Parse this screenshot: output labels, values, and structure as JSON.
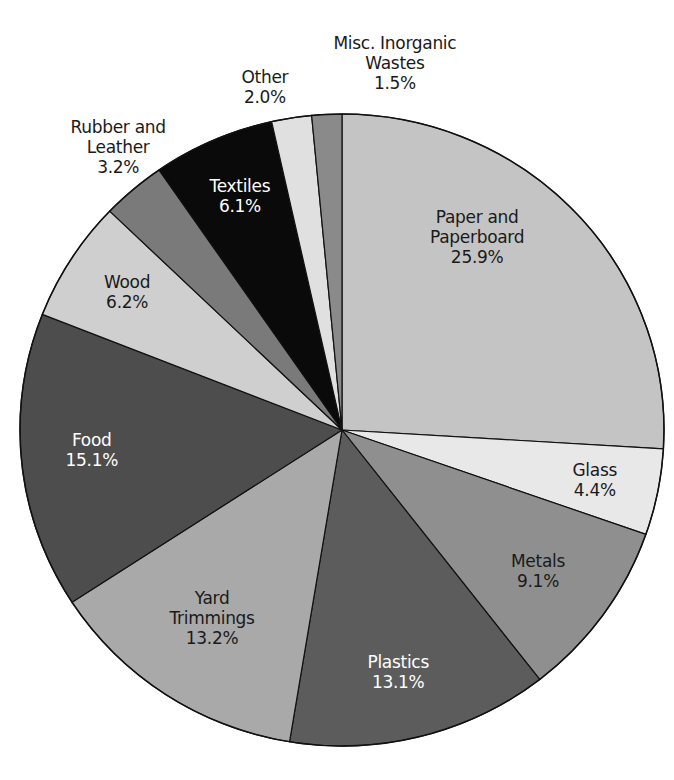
{
  "chart_data": {
    "type": "pie",
    "title": "",
    "start_angle_deg": 0,
    "direction": "clockwise",
    "slices": [
      {
        "name": "Paper and Paperboard",
        "lines": [
          "Paper and",
          "Paperboard",
          "25.9%"
        ],
        "value": 25.9,
        "color": "#c4c4c4",
        "label_pos": [
          477,
          237
        ],
        "light": false
      },
      {
        "name": "Glass",
        "lines": [
          "Glass",
          "4.4%"
        ],
        "value": 4.4,
        "color": "#e8e8e8",
        "label_pos": [
          595,
          480
        ],
        "light": false
      },
      {
        "name": "Metals",
        "lines": [
          "Metals",
          "9.1%"
        ],
        "value": 9.1,
        "color": "#8f8f8f",
        "label_pos": [
          538,
          571
        ],
        "light": false
      },
      {
        "name": "Plastics",
        "lines": [
          "Plastics",
          "13.1%"
        ],
        "value": 13.1,
        "color": "#5c5c5c",
        "label_pos": [
          398,
          672
        ],
        "light": true
      },
      {
        "name": "Yard Trimmings",
        "lines": [
          "Yard",
          "Trimmings",
          "13.2%"
        ],
        "value": 13.2,
        "color": "#a9a9a9",
        "label_pos": [
          212,
          618
        ],
        "light": false
      },
      {
        "name": "Food",
        "lines": [
          "Food",
          "15.1%"
        ],
        "value": 15.1,
        "color": "#4d4d4d",
        "label_pos": [
          92,
          450
        ],
        "light": true
      },
      {
        "name": "Wood",
        "lines": [
          "Wood",
          "6.2%"
        ],
        "value": 6.2,
        "color": "#cfcfcf",
        "label_pos": [
          127,
          292
        ],
        "light": false
      },
      {
        "name": "Rubber and Leather",
        "lines": [],
        "value": 3.2,
        "color": "#7a7a7a",
        "label_pos": null,
        "light": false
      },
      {
        "name": "Textiles",
        "lines": [
          "Textiles",
          "6.1%"
        ],
        "value": 6.1,
        "color": "#0a0a0a",
        "label_pos": [
          240,
          196
        ],
        "light": true
      },
      {
        "name": "Other",
        "lines": [],
        "value": 2.0,
        "color": "#e0e0e0",
        "label_pos": null,
        "light": false
      },
      {
        "name": "Misc. Inorganic Wastes",
        "lines": [],
        "value": 1.5,
        "color": "#8a8a8a",
        "label_pos": null,
        "light": false
      }
    ],
    "outside_labels": [
      {
        "name": "Rubber and Leather",
        "lines": [
          "Rubber and",
          "Leather",
          "3.2%"
        ],
        "pos": [
          118,
          147
        ]
      },
      {
        "name": "Other",
        "lines": [
          "Other",
          "2.0%"
        ],
        "pos": [
          265,
          87
        ]
      },
      {
        "name": "Misc. Inorganic Wastes",
        "lines": [
          "Misc. Inorganic",
          "Wastes",
          "1.5%"
        ],
        "pos": [
          395,
          63
        ]
      }
    ],
    "geometry": {
      "cx": 342,
      "cy": 430,
      "rx": 322,
      "ry": 316
    },
    "legend": null,
    "xlabel": "",
    "ylabel": ""
  }
}
